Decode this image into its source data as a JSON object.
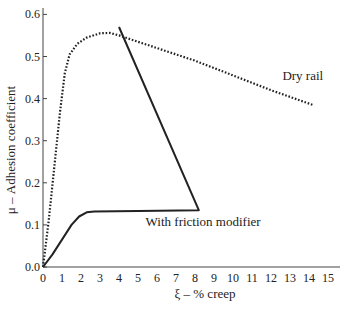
{
  "chart_data": {
    "type": "line",
    "title": "",
    "xlabel": "ξ – % creep",
    "ylabel": "μ – Adhesion coefficient",
    "xlim": [
      0,
      15.5
    ],
    "ylim": [
      0,
      0.62
    ],
    "x_ticks": [
      0,
      1,
      2,
      3,
      4,
      5,
      6,
      7,
      8,
      9,
      10,
      11,
      12,
      13,
      14,
      15
    ],
    "y_ticks": [
      {
        "value": 0.0,
        "label": "0.0"
      },
      {
        "value": 0.1,
        "label": "0.1"
      },
      {
        "value": 0.2,
        "label": "0.2"
      },
      {
        "value": 0.3,
        "label": "0.3"
      },
      {
        "value": 0.4,
        "label": "0.4"
      },
      {
        "value": 0.5,
        "label": "0.5"
      },
      {
        "value": 0.6,
        "label": "0.6"
      }
    ],
    "grid": false,
    "legend": "inline labels",
    "series": [
      {
        "name": "Dry rail",
        "style": "dotted",
        "label_pos": {
          "x": 12.6,
          "y": 0.445
        },
        "points": [
          [
            0,
            0
          ],
          [
            0.3,
            0.11
          ],
          [
            0.6,
            0.24
          ],
          [
            0.9,
            0.37
          ],
          [
            1.15,
            0.46
          ],
          [
            1.4,
            0.505
          ],
          [
            1.8,
            0.53
          ],
          [
            2.3,
            0.545
          ],
          [
            3.0,
            0.555
          ],
          [
            3.5,
            0.556
          ],
          [
            4.0,
            0.55
          ],
          [
            6,
            0.52
          ],
          [
            8,
            0.49
          ],
          [
            10,
            0.455
          ],
          [
            12,
            0.42
          ],
          [
            14.2,
            0.385
          ]
        ]
      },
      {
        "name": "With friction modifier",
        "style": "solid",
        "label_pos": {
          "x": 5.4,
          "y": 0.098
        },
        "points": [
          [
            0,
            0
          ],
          [
            0.5,
            0.03
          ],
          [
            1.0,
            0.065
          ],
          [
            1.5,
            0.1
          ],
          [
            1.9,
            0.12
          ],
          [
            2.3,
            0.13
          ],
          [
            2.7,
            0.132
          ],
          [
            5,
            0.133
          ],
          [
            8.2,
            0.135
          ],
          [
            4.0,
            0.57
          ]
        ]
      }
    ]
  }
}
